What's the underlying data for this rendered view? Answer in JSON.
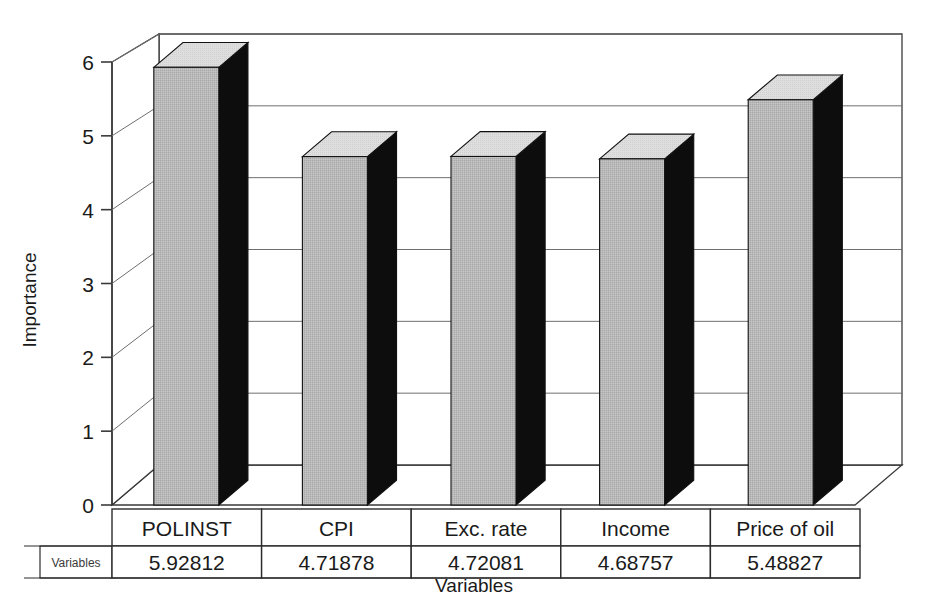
{
  "chart_data": {
    "type": "bar",
    "title": "",
    "xlabel": "Variables",
    "ylabel": "Importance",
    "categories": [
      "POLINST",
      "CPI",
      "Exc. rate",
      "Income",
      "Price of oil"
    ],
    "values": [
      5.92812,
      4.71878,
      4.72081,
      4.68757,
      5.48827
    ],
    "value_labels": [
      "5.92812",
      "4.71878",
      "4.72081",
      "4.68757",
      "5.48827"
    ],
    "ylim": [
      0,
      6
    ],
    "yticks": [
      0,
      1,
      2,
      3,
      4,
      5,
      6
    ],
    "ytick_labels": [
      "0",
      "1",
      "2",
      "3",
      "4",
      "5",
      "6"
    ],
    "grid": true,
    "grid_orientation": "horizontal",
    "legend": "none",
    "style": "3d-column",
    "series": [
      {
        "name": "Variables",
        "values": [
          5.92812,
          4.71878,
          4.72081,
          4.68757,
          5.48827
        ]
      }
    ]
  },
  "data_table": {
    "row_label": "Variables",
    "header": [
      "POLINST",
      "CPI",
      "Exc. rate",
      "Income",
      "Price of oil"
    ],
    "values": [
      "5.92812",
      "4.71878",
      "4.72081",
      "4.68757",
      "5.48827"
    ]
  },
  "colors": {
    "bar_front": "#b5b5b5",
    "bar_side": "#0d0d0d",
    "bar_top": "#dcdcdc",
    "bar_outline": "#111111",
    "grid": "#6f6f6f",
    "axis": "#3a3a3a",
    "table_border": "#2b2b2b",
    "background": "#ffffff",
    "text": "#1a1a1a"
  }
}
